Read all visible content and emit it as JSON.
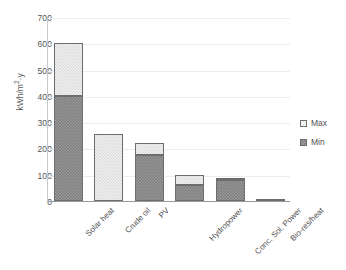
{
  "chart_data": {
    "type": "bar",
    "title": "",
    "subtitle": "",
    "xlabel": "",
    "ylabel": "kWh/m²·y",
    "ylabel_base": "kWh/m",
    "ylabel_sup": "2",
    "ylabel_tail": "·y",
    "categories": [
      "Solar heat",
      "Crude oil",
      "PV",
      "Hydropower",
      "Conc. Sol. Power",
      "Bio-res/heat"
    ],
    "series": [
      {
        "name": "Min",
        "values": [
          400,
          0,
          175,
          60,
          80,
          0
        ]
      },
      {
        "name": "Max",
        "values": [
          600,
          255,
          220,
          100,
          88,
          8
        ]
      }
    ],
    "stacked_note": "Bars are drawn as Min segment from 0 and Max segment stacked on top up to the Max total",
    "ylim": [
      0,
      700
    ],
    "ytick_values": [
      0,
      100,
      200,
      300,
      400,
      500,
      600,
      700
    ],
    "ytick_labels": [
      "0",
      "100",
      "200",
      "300",
      "400",
      "500",
      "600",
      "700"
    ],
    "ytick_step": 100,
    "grid": true,
    "grid_axis": "y",
    "legend_position": "right",
    "legend_entries": [
      "Max",
      "Min"
    ],
    "colors": {
      "min_fill": "#808080",
      "min_pattern": "#9d9d9d",
      "max_fill": "#f2f2f2",
      "max_pattern": "#d6d6d6",
      "bar_border": "#6d6d6d",
      "gridline": "#ededed",
      "axis": "#9a9a9a",
      "text": "#4f4f4f"
    }
  },
  "legend": {
    "max_label": "Max",
    "min_label": "Min"
  }
}
